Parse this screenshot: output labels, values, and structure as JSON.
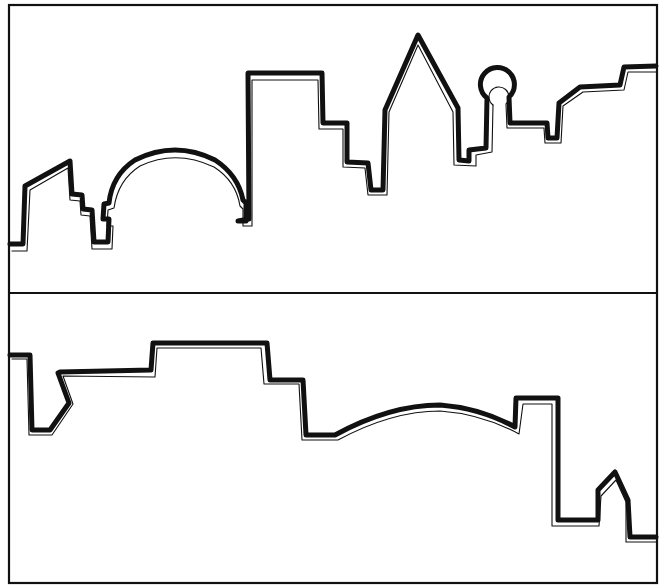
{
  "figure": {
    "colors": {
      "background": "#ffffff",
      "outline": "#111111",
      "frame": "#111111"
    },
    "panels": [
      {
        "name": "top-skyline",
        "features": [
          "stepped building",
          "dome",
          "tall block tower",
          "pointed spire tower",
          "round-top tower",
          "stepped rooftops"
        ]
      },
      {
        "name": "bottom-skyline",
        "features": [
          "notched building",
          "flat block",
          "stepped block",
          "arched roof",
          "tall tower",
          "small gabled house"
        ]
      }
    ]
  }
}
